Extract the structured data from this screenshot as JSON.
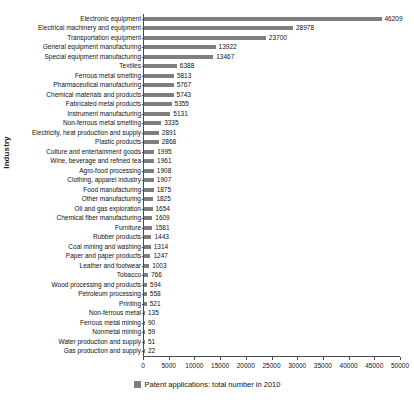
{
  "chart_data": {
    "type": "bar",
    "orientation": "horizontal",
    "title": "",
    "xlabel": "",
    "ylabel": "Industry",
    "xlim": [
      0,
      50000
    ],
    "xticks": [
      0,
      5000,
      10000,
      15000,
      20000,
      25000,
      30000,
      35000,
      40000,
      45000,
      50000
    ],
    "xtick_labels": [
      "0",
      "5000",
      "10000",
      "15000",
      "20000",
      "25000",
      "30000",
      "35000",
      "40000",
      "45000",
      "50000"
    ],
    "grid": false,
    "legend_position": "bottom-center",
    "series_color": "#7f7f7f",
    "legend": [
      "Patent applications: total number in 2010"
    ],
    "categories": [
      "Electronic equipment",
      "Electrical machinery and equipment",
      "Transportation equipment",
      "General equipment manufacturing",
      "Special equipment manufacturing",
      "Textiles",
      "Ferrous metal smelting",
      "Pharmaceutical manufacturing",
      "Chemical materials and products",
      "Fabricated metal products",
      "Instrument manufacturing",
      "Non-ferrous metal smelting",
      "Electricity, heat production and supply",
      "Plastic products",
      "Culture and entertainment goods",
      "Wine, beverage and refined tea",
      "Agro-food processing",
      "Clothing, apparel industry",
      "Food manufacturing",
      "Other manufacturing",
      "Oil and gas exploration",
      "Chemical fiber manufacturing",
      "Furniture",
      "Rubber products",
      "Coal mining and washing",
      "Paper and paper products",
      "Leather and footwear",
      "Tobacco",
      "Wood processing and products",
      "Petroleum processing",
      "Printing",
      "Non-ferrous metal",
      "Ferrous metal mining",
      "Nonmetal mining",
      "Water production and supply",
      "Gas production and supply"
    ],
    "values": [
      46209,
      28978,
      23700,
      13922,
      13467,
      6388,
      5813,
      5767,
      5743,
      5355,
      5131,
      3335,
      2891,
      2868,
      1995,
      1961,
      1908,
      1907,
      1875,
      1825,
      1654,
      1609,
      1581,
      1443,
      1314,
      1247,
      1003,
      766,
      594,
      558,
      521,
      135,
      90,
      59,
      51,
      22
    ],
    "value_labels": [
      "46209",
      "28978",
      "23700",
      "13922",
      "13467",
      "6388",
      "5813",
      "5767",
      "5743",
      "5355",
      "5131",
      "3335",
      "2891",
      "2868",
      "1995",
      "1961",
      "1908",
      "1907",
      "1875",
      "1825",
      "1654",
      "1609",
      "1581",
      "1443",
      "1314",
      "1247",
      "1003",
      "766",
      "594",
      "558",
      "521",
      "135",
      "90",
      "59",
      "51",
      "22"
    ]
  }
}
